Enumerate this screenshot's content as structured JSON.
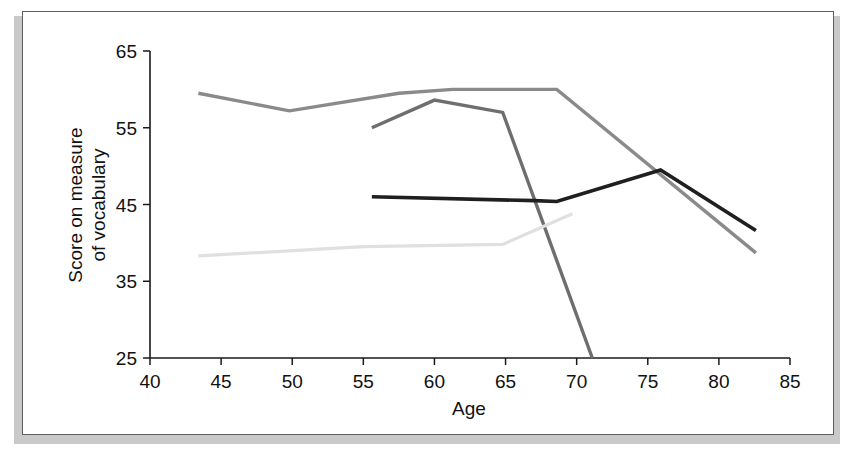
{
  "figure": {
    "name": "vocabulary-score-by-age-line-chart",
    "background": "#ffffff",
    "frame_color": "#5e5e5e",
    "shadow_color": "#c9c9c9"
  },
  "chart_data": {
    "type": "line",
    "title": "",
    "xlabel": "Age",
    "ylabel": "Score on measure of vocabulary",
    "ylabel_lines": [
      "Score on measure",
      "of vocabulary"
    ],
    "xlim": [
      40,
      85
    ],
    "ylim": [
      25,
      65
    ],
    "xticks": [
      40,
      45,
      50,
      55,
      60,
      65,
      70,
      75,
      80,
      85
    ],
    "xtick_labels": [
      "40",
      "45",
      "50",
      "55",
      "60",
      "65",
      "70",
      "75",
      "80",
      "85"
    ],
    "yticks": [
      25,
      35,
      45,
      55,
      65
    ],
    "ytick_labels": [
      "25",
      "35",
      "45",
      "55",
      "65"
    ],
    "grid": false,
    "legend": false,
    "legend_position": "none",
    "series": [
      {
        "name": "cohort-medium-gray",
        "color": "#8a8a8a",
        "width": 3.4,
        "x": [
          43.4,
          49.8,
          57.5,
          61.3,
          68.6,
          82.6
        ],
        "y": [
          59.5,
          57.2,
          59.5,
          60.0,
          60.0,
          38.7
        ]
      },
      {
        "name": "cohort-dark-gray",
        "color": "#6e6e6e",
        "width": 3.4,
        "x": [
          55.6,
          60.0,
          64.8,
          71.1
        ],
        "y": [
          55.0,
          58.6,
          57.0,
          25.0
        ]
      },
      {
        "name": "cohort-black",
        "color": "#1f1f1f",
        "width": 3.6,
        "x": [
          55.6,
          67.0,
          68.6,
          75.9,
          82.6
        ],
        "y": [
          46.0,
          45.5,
          45.4,
          49.5,
          41.6
        ]
      },
      {
        "name": "cohort-light-gray",
        "color": "#e0e0e0",
        "width": 3.2,
        "x": [
          43.4,
          55.0,
          64.8,
          69.7
        ],
        "y": [
          38.3,
          39.5,
          39.8,
          43.8
        ]
      }
    ]
  }
}
